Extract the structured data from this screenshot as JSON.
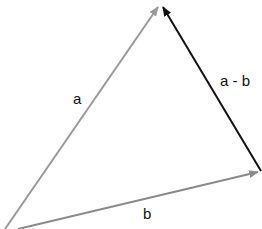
{
  "diagram": {
    "vectors": [
      {
        "label": "a",
        "color": "#9a9a9a",
        "from": [
          5,
          229
        ],
        "to": [
          158,
          7
        ]
      },
      {
        "label": "b",
        "color": "#8a8a8a",
        "from": [
          18,
          229
        ],
        "to": [
          258,
          172
        ]
      },
      {
        "label": "a - b",
        "color": "#111111",
        "from": [
          261,
          171
        ],
        "to": [
          163,
          7
        ]
      }
    ],
    "labels": {
      "a": "a",
      "b": "b",
      "a_minus_b": "a - b"
    }
  }
}
